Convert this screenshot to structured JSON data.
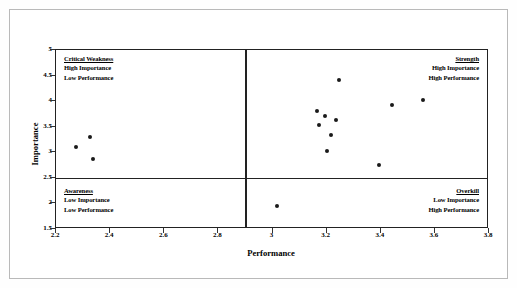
{
  "chart_data": {
    "type": "scatter",
    "title": "",
    "xlabel": "Performance",
    "ylabel": "Importance",
    "xlim": [
      2.2,
      3.8
    ],
    "ylim": [
      1.5,
      5.0
    ],
    "xticks": [
      "2.2",
      "2.4",
      "2.6",
      "2.8",
      "3",
      "3.2",
      "3.4",
      "3.6",
      "3.8"
    ],
    "xtick_values": [
      2.2,
      2.4,
      2.6,
      2.8,
      3.0,
      3.2,
      3.4,
      3.6,
      3.8
    ],
    "yticks": [
      "1.5",
      "2",
      "2.5",
      "3",
      "3.5",
      "4",
      "4.5",
      "5"
    ],
    "ytick_values": [
      1.5,
      2.0,
      2.5,
      3.0,
      3.5,
      4.0,
      4.5,
      5.0
    ],
    "grid": false,
    "legend": "none",
    "crosshair_x": 2.9,
    "crosshair_y": 2.5,
    "points": [
      {
        "x": 2.275,
        "y": 3.11
      },
      {
        "x": 2.325,
        "y": 3.29
      },
      {
        "x": 2.335,
        "y": 2.86
      },
      {
        "x": 3.015,
        "y": 1.95
      },
      {
        "x": 3.165,
        "y": 3.81
      },
      {
        "x": 3.17,
        "y": 3.53
      },
      {
        "x": 3.195,
        "y": 3.7
      },
      {
        "x": 3.2,
        "y": 3.03
      },
      {
        "x": 3.215,
        "y": 3.33
      },
      {
        "x": 3.235,
        "y": 3.63
      },
      {
        "x": 3.245,
        "y": 4.42
      },
      {
        "x": 3.395,
        "y": 2.76
      },
      {
        "x": 3.44,
        "y": 3.93
      },
      {
        "x": 3.555,
        "y": 4.03
      }
    ],
    "quadrants": [
      {
        "id": "critical-weakness",
        "position": "top-left",
        "title": "Critical Weakness",
        "line1": "High Importance",
        "line2": "Low Performance"
      },
      {
        "id": "strength",
        "position": "top-right",
        "title": "Strength",
        "line1": "High Importance",
        "line2": "High Performance"
      },
      {
        "id": "awareness",
        "position": "bottom-left",
        "title": "Awareness",
        "line1": "Low Importance",
        "line2": "Low Performance"
      },
      {
        "id": "overkill",
        "position": "bottom-right",
        "title": "Overkill",
        "line1": "Low Importance",
        "line2": "High Performance"
      }
    ],
    "colors": {
      "point": "#1a1a1a",
      "axis": "#222222",
      "frame": "#b9b9b9",
      "background": "#ffffff"
    }
  }
}
